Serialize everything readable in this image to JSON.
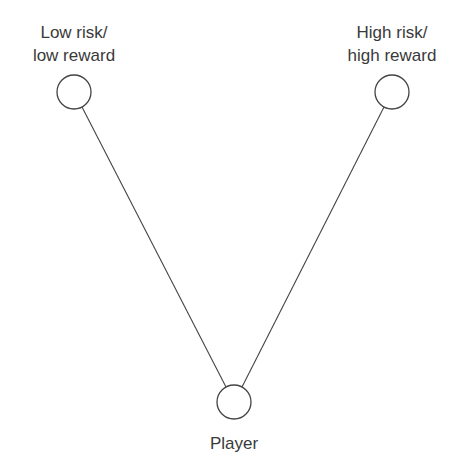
{
  "diagram": {
    "nodes": [
      {
        "id": "low",
        "label_lines": [
          "Low risk/",
          "low reward"
        ]
      },
      {
        "id": "high",
        "label_lines": [
          "High risk/",
          "high reward"
        ]
      },
      {
        "id": "player",
        "label_lines": [
          "Player"
        ]
      }
    ],
    "edges": [
      {
        "from": "player",
        "to": "low"
      },
      {
        "from": "player",
        "to": "high"
      }
    ]
  }
}
